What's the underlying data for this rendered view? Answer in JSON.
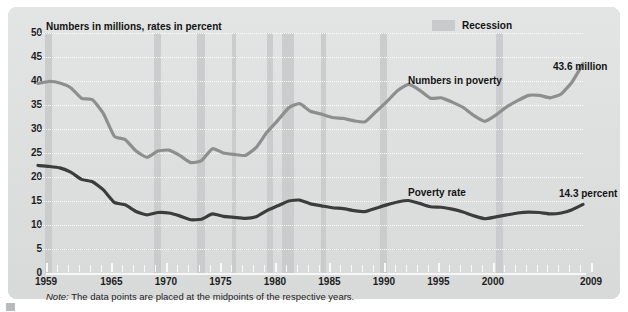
{
  "chart_title": "Numbers in millions, rates in percent",
  "legend": {
    "recession_label": "Recession",
    "recession_color": "#c9cacb"
  },
  "annotations": {
    "numbers_series": "Numbers in poverty",
    "rate_series": "Poverty rate",
    "end_numbers": "43.6 million",
    "end_rate": "14.3 percent"
  },
  "note": {
    "prefix": "Note:",
    "text": "The data points are placed at the midpoints of the respective years."
  },
  "chart_data": {
    "type": "line",
    "title": "Numbers in millions, rates in percent",
    "xlabel": "",
    "ylabel": "Numbers in millions, rates in percent",
    "ylim": [
      0,
      50
    ],
    "yticks": [
      0,
      5,
      10,
      15,
      20,
      25,
      30,
      35,
      40,
      45,
      50
    ],
    "xlim": [
      1959,
      2009
    ],
    "xticks": [
      1959,
      1965,
      1970,
      1975,
      1980,
      1985,
      1990,
      1995,
      2000,
      2009
    ],
    "xtick_labels": [
      "1959",
      "1965",
      "1970",
      "1975",
      "1980",
      "1985",
      "1990",
      "1995",
      "2000",
      "2009"
    ],
    "grid": true,
    "legend_position": "top-right",
    "x": [
      1959,
      1960,
      1961,
      1962,
      1963,
      1964,
      1965,
      1966,
      1967,
      1968,
      1969,
      1970,
      1971,
      1972,
      1973,
      1974,
      1975,
      1976,
      1977,
      1978,
      1979,
      1980,
      1981,
      1982,
      1983,
      1984,
      1985,
      1986,
      1987,
      1988,
      1989,
      1990,
      1991,
      1992,
      1993,
      1994,
      1995,
      1996,
      1997,
      1998,
      1999,
      2000,
      2001,
      2002,
      2003,
      2004,
      2005,
      2006,
      2007,
      2008,
      2009
    ],
    "series": [
      {
        "name": "Numbers in poverty",
        "units": "millions",
        "color": "#8d8f8f",
        "end_label": "43.6 million",
        "values": [
          39.5,
          39.9,
          39.6,
          38.6,
          36.4,
          36.1,
          33.2,
          28.5,
          27.8,
          25.4,
          24.1,
          25.4,
          25.6,
          24.5,
          23.0,
          23.4,
          25.9,
          25.0,
          24.7,
          24.5,
          26.1,
          29.3,
          31.8,
          34.4,
          35.3,
          33.7,
          33.1,
          32.4,
          32.2,
          31.7,
          31.5,
          33.6,
          35.7,
          38.0,
          39.3,
          38.1,
          36.4,
          36.5,
          35.6,
          34.5,
          32.8,
          31.6,
          32.9,
          34.6,
          35.9,
          37.0,
          37.0,
          36.5,
          37.3,
          39.8,
          43.6
        ]
      },
      {
        "name": "Poverty rate",
        "units": "percent",
        "color": "#3c3c3c",
        "end_label": "14.3 percent",
        "values": [
          22.4,
          22.2,
          21.9,
          21.0,
          19.5,
          19.0,
          17.3,
          14.7,
          14.2,
          12.8,
          12.1,
          12.6,
          12.5,
          11.9,
          11.1,
          11.2,
          12.3,
          11.8,
          11.6,
          11.4,
          11.7,
          13.0,
          14.0,
          15.0,
          15.2,
          14.4,
          14.0,
          13.6,
          13.4,
          13.0,
          12.8,
          13.5,
          14.2,
          14.8,
          15.1,
          14.5,
          13.8,
          13.7,
          13.3,
          12.7,
          11.9,
          11.3,
          11.7,
          12.1,
          12.5,
          12.7,
          12.6,
          12.3,
          12.5,
          13.2,
          14.3
        ]
      }
    ],
    "recessions": [
      {
        "start": 1959.6,
        "end": 1960.3
      },
      {
        "start": 1969.6,
        "end": 1970.3
      },
      {
        "start": 1973.6,
        "end": 1974.3
      },
      {
        "start": 1976.8,
        "end": 1977.2
      },
      {
        "start": 1980.0,
        "end": 1980.6
      },
      {
        "start": 1981.4,
        "end": 1982.5
      },
      {
        "start": 1985.0,
        "end": 1985.4
      },
      {
        "start": 1990.4,
        "end": 1991.0
      },
      {
        "start": 2001.0,
        "end": 2001.7
      }
    ]
  }
}
